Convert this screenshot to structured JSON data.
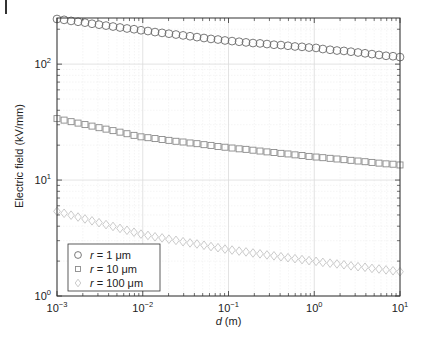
{
  "chart_data": {
    "type": "scatter",
    "title": "",
    "xlabel": "d (m)",
    "ylabel": "Electric field (kV/mm)",
    "xscale": "log",
    "yscale": "log",
    "xlim": [
      0.001,
      10
    ],
    "ylim": [
      1,
      250
    ],
    "grid": true,
    "minor_grid": true,
    "legend_position": "lower left",
    "x_ticks": [
      {
        "value": 0.001,
        "base": "10",
        "exp": "−3"
      },
      {
        "value": 0.01,
        "base": "10",
        "exp": "−2"
      },
      {
        "value": 0.1,
        "base": "10",
        "exp": "−1"
      },
      {
        "value": 1,
        "base": "10",
        "exp": "0"
      },
      {
        "value": 10,
        "base": "10",
        "exp": "1"
      }
    ],
    "y_ticks": [
      {
        "value": 1,
        "base": "10",
        "exp": "0"
      },
      {
        "value": 10,
        "base": "10",
        "exp": "1"
      },
      {
        "value": 100,
        "base": "10",
        "exp": "2"
      }
    ],
    "x": [
      0.001,
      0.00121,
      0.00146,
      0.00176,
      0.00212,
      0.00256,
      0.00309,
      0.00373,
      0.0045,
      0.00543,
      0.00655,
      0.00791,
      0.00954,
      0.0115,
      0.0139,
      0.0168,
      0.0202,
      0.0244,
      0.0295,
      0.0356,
      0.0429,
      0.0518,
      0.0625,
      0.0754,
      0.091,
      0.11,
      0.133,
      0.16,
      0.193,
      0.233,
      0.281,
      0.339,
      0.409,
      0.494,
      0.596,
      0.72,
      0.869,
      1.05,
      1.26,
      1.53,
      1.84,
      2.22,
      2.68,
      3.24,
      3.91,
      4.71,
      5.69,
      6.87,
      8.29,
      10
    ],
    "series": [
      {
        "name": "r = 1 μm",
        "var": "r",
        "rest": " = 1 μm",
        "marker": "circle",
        "color": "#6b6b6b",
        "values": [
          245,
          241,
          236,
          232,
          228,
          223,
          219,
          215,
          211,
          207,
          203,
          200,
          196,
          193,
          189,
          186,
          183,
          180,
          177,
          174,
          171,
          168,
          165,
          163,
          160,
          158,
          156,
          154,
          152,
          151,
          149,
          147,
          146,
          144,
          142,
          141,
          139,
          138,
          135,
          133,
          131,
          130,
          128,
          126,
          124,
          122,
          120,
          118,
          117,
          115
        ]
      },
      {
        "name": "r = 10 μm",
        "var": "r",
        "rest": " = 10 μm",
        "marker": "square",
        "color": "#8a8a8a",
        "values": [
          33.9,
          32.9,
          31.9,
          31.0,
          30.1,
          29.2,
          28.3,
          27.5,
          26.7,
          25.9,
          25.1,
          24.3,
          23.6,
          23.2,
          22.8,
          22.4,
          22.0,
          21.6,
          21.3,
          20.9,
          20.6,
          20.2,
          19.9,
          19.5,
          19.2,
          18.9,
          18.6,
          18.4,
          18.1,
          17.8,
          17.5,
          17.3,
          17.0,
          16.8,
          16.5,
          16.3,
          16.0,
          15.8,
          15.6,
          15.4,
          15.2,
          15.0,
          14.8,
          14.6,
          14.4,
          14.2,
          14.0,
          13.8,
          13.7,
          13.5
        ]
      },
      {
        "name": "r = 100 μm",
        "var": "r",
        "rest": " = 100 μm",
        "marker": "diamond",
        "color": "#c4c4c4",
        "values": [
          5.37,
          5.17,
          4.98,
          4.8,
          4.62,
          4.45,
          4.29,
          4.13,
          3.98,
          3.83,
          3.69,
          3.55,
          3.42,
          3.33,
          3.24,
          3.17,
          3.09,
          3.02,
          2.94,
          2.87,
          2.81,
          2.74,
          2.67,
          2.61,
          2.54,
          2.49,
          2.44,
          2.4,
          2.35,
          2.31,
          2.26,
          2.22,
          2.18,
          2.14,
          2.1,
          2.06,
          2.02,
          1.99,
          1.95,
          1.92,
          1.89,
          1.86,
          1.82,
          1.79,
          1.77,
          1.73,
          1.71,
          1.68,
          1.65,
          1.62
        ]
      }
    ]
  },
  "colors": {
    "frame": "#333333",
    "major_grid": "#dcdcdc",
    "minor_grid": "#efefef"
  }
}
